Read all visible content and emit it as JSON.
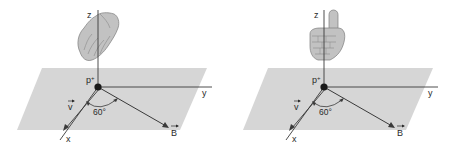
{
  "colors": {
    "plane": "#d4d4d4",
    "axis": "#3a3a3a",
    "hand": "#bdbdbd",
    "hand_outline": "#7a7a7a",
    "proton": "#1a1a1a"
  },
  "panels": [
    {
      "name": "left",
      "hand": "flat-hand-fingers-curled",
      "labels": {
        "z": "z",
        "y": "y",
        "x": "x",
        "charge": "p",
        "charge_sign": "+",
        "velocity": "v",
        "field": "B",
        "angle": "60°"
      }
    },
    {
      "name": "right",
      "hand": "thumbs-up-right-hand",
      "labels": {
        "z": "z",
        "y": "y",
        "x": "x",
        "charge": "p",
        "charge_sign": "+",
        "velocity": "v",
        "field": "B",
        "angle": "60°"
      }
    }
  ]
}
